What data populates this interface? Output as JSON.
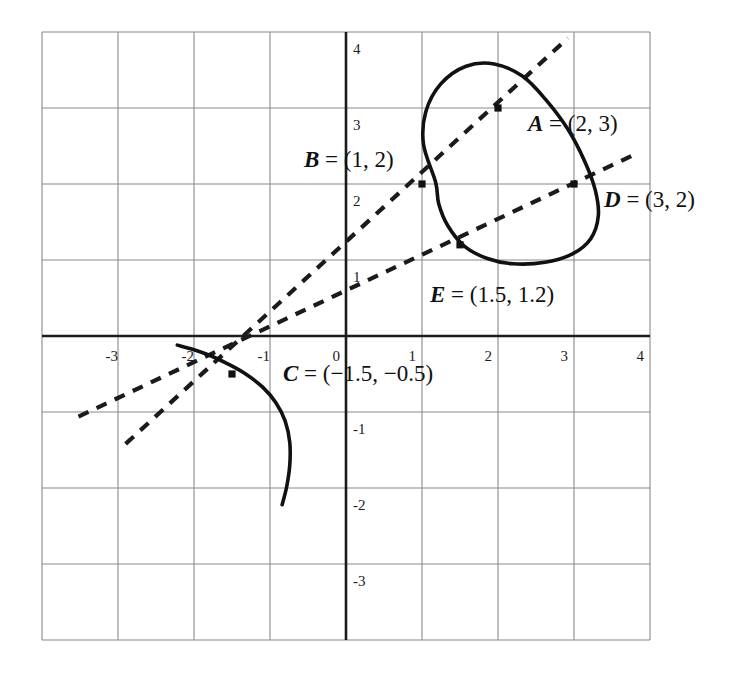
{
  "figure": {
    "title": "",
    "background_color": "#ffffff",
    "curve_color": "#111111",
    "grid_color": "#8a8a8a",
    "axis_color": "#1b1b1b",
    "dashed_color": "#1b1b1b"
  },
  "axes": {
    "x_ticks": [
      "-3",
      "-2",
      "-1",
      "0",
      "1",
      "2",
      "3",
      "4"
    ],
    "x_tick_values": [
      -3,
      -2,
      -1,
      0,
      1,
      2,
      3,
      4
    ],
    "y_ticks": [
      "4",
      "3",
      "2",
      "1",
      "-1",
      "-2",
      "-3"
    ],
    "y_tick_values": [
      4,
      3,
      2,
      1,
      -1,
      -2,
      -3
    ],
    "xlim": [
      -4,
      4
    ],
    "ylim": [
      -4,
      4
    ],
    "grid": true,
    "grid_step": 1
  },
  "labels": {
    "A": {
      "var": "A",
      "eq": " = (2, 3)",
      "full": "A = (2, 3)"
    },
    "B": {
      "var": "B",
      "eq": " = (1, 2)",
      "full": "B = (1, 2)"
    },
    "C": {
      "var": "C",
      "eq": " = (−1.5, −0.5)",
      "full": "C = (−1.5, −0.5)"
    },
    "D": {
      "var": "D",
      "eq": " = (3, 2)",
      "full": "D = (3, 2)"
    },
    "E": {
      "var": "E",
      "eq": " = (1.5, 1.2)",
      "full": "E = (1.5, 1.2)"
    }
  },
  "chart_data": {
    "type": "scatter",
    "title": "",
    "xlabel": "",
    "ylabel": "",
    "xlim": [
      -4,
      4
    ],
    "ylim": [
      -4,
      4
    ],
    "grid": true,
    "legend": "none",
    "points": [
      {
        "name": "A",
        "x": 2,
        "y": 3,
        "label": "A = (2, 3)"
      },
      {
        "name": "B",
        "x": 1,
        "y": 2,
        "label": "B = (1, 2)"
      },
      {
        "name": "C",
        "x": -1.5,
        "y": -0.5,
        "label": "C = (−1.5, −0.5)"
      },
      {
        "name": "D",
        "x": 3,
        "y": 2,
        "label": "D = (3, 2)"
      },
      {
        "name": "E",
        "x": 1.5,
        "y": 1.2,
        "label": "E = (1.5, 1.2)"
      }
    ],
    "series": [
      {
        "name": "implicit-curve-loop",
        "style": "solid",
        "closed": true,
        "points": [
          [
            1.18,
            2.02
          ],
          [
            1.02,
            2.52
          ],
          [
            1.05,
            2.95
          ],
          [
            1.25,
            3.32
          ],
          [
            1.58,
            3.55
          ],
          [
            1.95,
            3.58
          ],
          [
            2.32,
            3.42
          ],
          [
            2.62,
            3.12
          ],
          [
            2.92,
            2.72
          ],
          [
            3.14,
            2.3
          ],
          [
            3.28,
            1.92
          ],
          [
            3.32,
            1.58
          ],
          [
            3.22,
            1.28
          ],
          [
            2.98,
            1.08
          ],
          [
            2.62,
            0.97
          ],
          [
            2.2,
            0.95
          ],
          [
            1.86,
            1.02
          ],
          [
            1.56,
            1.18
          ],
          [
            1.34,
            1.45
          ],
          [
            1.22,
            1.74
          ],
          [
            1.18,
            2.02
          ]
        ]
      },
      {
        "name": "implicit-curve-branch",
        "style": "solid",
        "closed": false,
        "points": [
          [
            -2.22,
            -0.12
          ],
          [
            -2.0,
            -0.18
          ],
          [
            -1.78,
            -0.26
          ],
          [
            -1.55,
            -0.37
          ],
          [
            -1.32,
            -0.5
          ],
          [
            -1.1,
            -0.67
          ],
          [
            -0.92,
            -0.88
          ],
          [
            -0.8,
            -1.12
          ],
          [
            -0.74,
            -1.4
          ],
          [
            -0.74,
            -1.7
          ],
          [
            -0.78,
            -1.98
          ],
          [
            -0.84,
            -2.22
          ]
        ]
      },
      {
        "name": "tangent-line-steep",
        "style": "dashed",
        "closed": false,
        "points": [
          [
            -2.9,
            -1.42
          ],
          [
            2.92,
            3.92
          ]
        ]
      },
      {
        "name": "tangent-line-shallow",
        "style": "dashed",
        "closed": false,
        "points": [
          [
            -3.52,
            -1.06
          ],
          [
            3.78,
            2.38
          ]
        ]
      }
    ]
  }
}
